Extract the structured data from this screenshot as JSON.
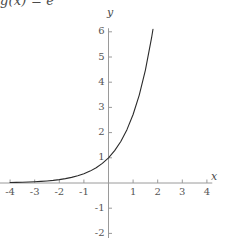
{
  "figure": {
    "title_prefix": "g(x) = e",
    "title_exponent": "x",
    "background_color": "#ffffff",
    "axis_color": "#9a9a9a",
    "curve_color": "#2b2b2b",
    "text_color": "#555555"
  },
  "chart_data": {
    "type": "line",
    "xlabel": "x",
    "ylabel": "y",
    "xlim": [
      -4.3,
      4.3
    ],
    "ylim": [
      -2.2,
      6.3
    ],
    "grid": false,
    "legend": null,
    "xticks": [
      -4,
      -3,
      -2,
      -1,
      1,
      2,
      3,
      4
    ],
    "xtick_labels": [
      "-4",
      "-3",
      "-2",
      "-1",
      "1",
      "2",
      "3",
      "4"
    ],
    "yticks": [
      -2,
      -1,
      1,
      2,
      3,
      4,
      5,
      6
    ],
    "ytick_labels": [
      "-2",
      "-1",
      "1",
      "2",
      "3",
      "4",
      "5",
      "6"
    ],
    "series": [
      {
        "name": "g(x) = e^x",
        "x": [
          -4.0,
          -3.75,
          -3.5,
          -3.25,
          -3.0,
          -2.75,
          -2.5,
          -2.25,
          -2.0,
          -1.75,
          -1.5,
          -1.25,
          -1.0,
          -0.75,
          -0.5,
          -0.25,
          0.0,
          0.25,
          0.5,
          0.75,
          1.0,
          1.25,
          1.5,
          1.75,
          2.0,
          2.25,
          2.5,
          2.75,
          3.0,
          3.25,
          3.5,
          3.6
        ],
        "y": [
          0.018,
          0.024,
          0.03,
          0.039,
          0.05,
          0.064,
          0.082,
          0.105,
          0.135,
          0.174,
          0.223,
          0.287,
          0.368,
          0.472,
          0.607,
          0.779,
          1.0,
          1.284,
          1.649,
          2.117,
          2.718,
          3.49,
          4.482,
          5.755,
          7.389,
          9.488,
          12.182,
          15.643,
          20.086,
          25.79,
          33.115,
          36.598
        ]
      }
    ]
  },
  "axes": {
    "y_label": "y",
    "x_label": "x"
  },
  "ticks": {
    "x": [
      {
        "label": "-4",
        "value": -4
      },
      {
        "label": "-3",
        "value": -3
      },
      {
        "label": "-2",
        "value": -2
      },
      {
        "label": "-1",
        "value": -1
      },
      {
        "label": "1",
        "value": 1
      },
      {
        "label": "2",
        "value": 2
      },
      {
        "label": "3",
        "value": 3
      },
      {
        "label": "4",
        "value": 4
      }
    ],
    "y": [
      {
        "label": "6",
        "value": 6
      },
      {
        "label": "5",
        "value": 5
      },
      {
        "label": "4",
        "value": 4
      },
      {
        "label": "3",
        "value": 3
      },
      {
        "label": "2",
        "value": 2
      },
      {
        "label": "1",
        "value": 1
      },
      {
        "label": "-1",
        "value": -1
      },
      {
        "label": "-2",
        "value": -2
      }
    ]
  }
}
